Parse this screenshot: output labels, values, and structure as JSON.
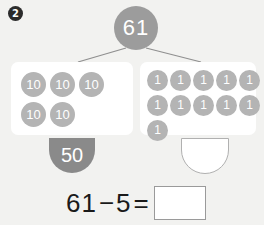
{
  "problem": {
    "number": "2"
  },
  "number_bond": {
    "total": "61",
    "tens_group": {
      "disc_label": "10",
      "rows": [
        [
          "10",
          "10",
          "10"
        ],
        [
          "10",
          "10"
        ]
      ],
      "value_label": "50"
    },
    "ones_group": {
      "disc_label": "1",
      "rows": [
        [
          "1",
          "1",
          "1",
          "1",
          "1"
        ],
        [
          "1",
          "1",
          "1",
          "1",
          "1"
        ],
        [
          "1"
        ]
      ],
      "value_label": ""
    }
  },
  "equation": {
    "minuend": "61",
    "operator": "−",
    "subtrahend": "5",
    "equals": "=",
    "answer": ""
  },
  "colors": {
    "page_background": "#f2f2f0",
    "card_background": "#ffffff",
    "disc_gray": "#b4b4b4",
    "total_gray": "#9c9c9c",
    "value_gray": "#8a8a8a",
    "badge_dark": "#2b2b2b",
    "line_gray": "#8f8f8f",
    "text_dark": "#1a1a1a"
  }
}
